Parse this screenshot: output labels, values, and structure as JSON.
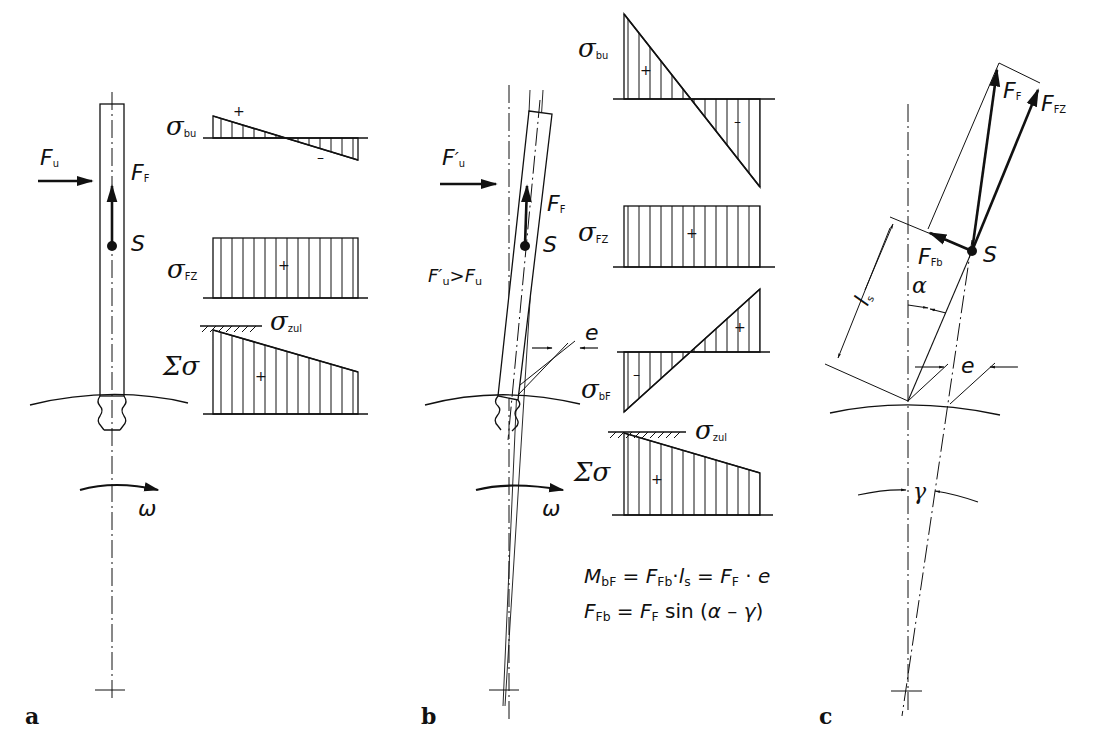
{
  "figure": {
    "panels": [
      {
        "id": "a",
        "letter": "a"
      },
      {
        "id": "b",
        "letter": "b"
      },
      {
        "id": "c",
        "letter": "c"
      }
    ]
  },
  "panel_a": {
    "force_u": {
      "sym": "F",
      "sub": "u"
    },
    "force_f": {
      "sym": "F",
      "sub": "F"
    },
    "point_s": "S",
    "omega": "ω",
    "diagrams": {
      "sigma_bu": {
        "sym": "σ",
        "sub": "bu",
        "plus": "+",
        "minus": "–"
      },
      "sigma_fz": {
        "sym": "σ",
        "sub": "FZ",
        "plus": "+"
      },
      "sigma_zul": {
        "sym": "σ",
        "sub": "zul"
      },
      "sigma_sum": {
        "sym": "Σσ",
        "plus": "+"
      }
    }
  },
  "panel_b": {
    "force_u_prime": {
      "sym": "F",
      "prime": "′",
      "sub": "u"
    },
    "force_f": {
      "sym": "F",
      "sub": "F"
    },
    "point_s": "S",
    "inequality": {
      "lhs_sym": "F",
      "lhs_prime": "′",
      "lhs_sub": "u",
      "op": ">",
      "rhs_sym": "F",
      "rhs_sub": "u"
    },
    "eccentricity": "e",
    "omega": "ω",
    "diagrams": {
      "sigma_bu": {
        "sym": "σ",
        "sub": "bu",
        "plus": "+",
        "minus": "–"
      },
      "sigma_fz": {
        "sym": "σ",
        "sub": "FZ",
        "plus": "+"
      },
      "sigma_bf": {
        "sym": "σ",
        "sub": "bF",
        "plus": "+",
        "minus": "–"
      },
      "sigma_zul": {
        "sym": "σ",
        "sub": "zul"
      },
      "sigma_sum": {
        "sym": "Σσ",
        "plus": "+"
      }
    },
    "formulas": {
      "line1": {
        "a": "M",
        "a_sub": "bF",
        "eq1": " = ",
        "b": "F",
        "b_sub": "Fb",
        "dot1": "·",
        "c": "l",
        "c_sub": "s",
        "eq2": " = ",
        "d": "F",
        "d_sub": "F",
        "dot2": " · ",
        "e": "e"
      },
      "line2": {
        "a": "F",
        "a_sub": "Fb",
        "eq": " = ",
        "b": "F",
        "b_sub": "F",
        "fn": " sin (",
        "alpha": "α",
        "minus": " – ",
        "gamma": "γ",
        "close": ")"
      }
    }
  },
  "panel_c": {
    "force_f": {
      "sym": "F",
      "sub": "F"
    },
    "force_fz": {
      "sym": "F",
      "sub": "FZ"
    },
    "force_fb": {
      "sym": "F",
      "sub": "Fb"
    },
    "point_s": "S",
    "length_ls": {
      "sym": "l",
      "sub": "s"
    },
    "alpha": "α",
    "eccentricity": "e",
    "gamma": "γ"
  },
  "colors": {
    "ink": "#111111",
    "background": "#ffffff"
  }
}
